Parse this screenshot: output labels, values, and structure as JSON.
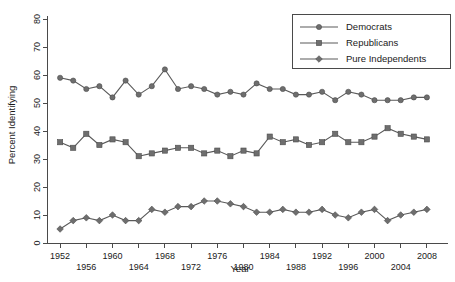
{
  "chart_data": {
    "type": "line",
    "title": "",
    "xlabel": "Year",
    "ylabel": "Percent Identifying",
    "xlim": [
      1950,
      2010
    ],
    "ylim": [
      0,
      80
    ],
    "grid": false,
    "legend_position": "top-right",
    "x": [
      1952,
      1954,
      1956,
      1958,
      1960,
      1962,
      1964,
      1966,
      1968,
      1970,
      1972,
      1974,
      1976,
      1978,
      1980,
      1982,
      1984,
      1986,
      1988,
      1990,
      1992,
      1994,
      1996,
      1998,
      2000,
      2002,
      2004,
      2006,
      2008
    ],
    "xticks": [
      1952,
      1956,
      1960,
      1964,
      1968,
      1972,
      1976,
      1980,
      1984,
      1988,
      1992,
      1996,
      2000,
      2004,
      2008
    ],
    "yticks": [
      0,
      10,
      20,
      30,
      40,
      50,
      60,
      70,
      80
    ],
    "series": [
      {
        "name": "Democrats",
        "marker": "circle",
        "color": "#6e6e6e",
        "values": [
          59,
          58,
          55,
          56,
          52,
          58,
          53,
          56,
          62,
          55,
          56,
          55,
          53,
          54,
          53,
          57,
          55,
          55,
          53,
          53,
          54,
          51,
          54,
          53,
          51,
          51,
          51,
          52,
          52
        ]
      },
      {
        "name": "Republicans",
        "marker": "square",
        "color": "#6e6e6e",
        "values": [
          36,
          34,
          39,
          35,
          37,
          36,
          31,
          32,
          33,
          34,
          34,
          32,
          33,
          31,
          33,
          32,
          38,
          36,
          37,
          35,
          36,
          39,
          36,
          36,
          38,
          41,
          39,
          38,
          37
        ]
      },
      {
        "name": "Pure Independents",
        "marker": "diamond",
        "color": "#6e6e6e",
        "values": [
          5,
          8,
          9,
          8,
          10,
          8,
          8,
          12,
          11,
          13,
          13,
          15,
          15,
          14,
          13,
          11,
          11,
          12,
          11,
          11,
          12,
          10,
          9,
          11,
          12,
          8,
          10,
          11,
          12
        ]
      }
    ]
  },
  "axes": {
    "y_title": "Percent Identifying",
    "x_title": "Year"
  },
  "legend": {
    "entries": [
      {
        "label": "Democrats",
        "marker": "circle"
      },
      {
        "label": "Republicans",
        "marker": "square"
      },
      {
        "label": "Pure Independents",
        "marker": "diamond"
      }
    ]
  }
}
